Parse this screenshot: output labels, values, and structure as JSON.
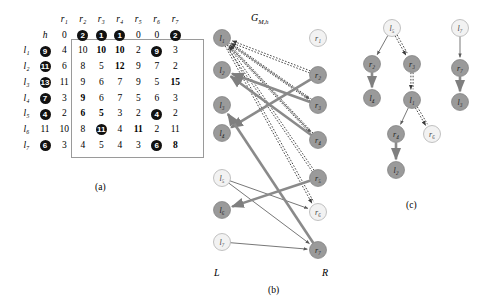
{
  "figure": {
    "panels": [
      {
        "id": "a",
        "caption": "(a)"
      },
      {
        "id": "b",
        "caption": "(b)"
      },
      {
        "id": "c",
        "caption": "(c)"
      }
    ]
  },
  "matrix": {
    "h_label": "h",
    "col_headers": [
      "r₁",
      "r₂",
      "r₃",
      "r₄",
      "r₅",
      "r₆",
      "r₇"
    ],
    "h_row": [
      {
        "v": "0",
        "style": "plain"
      },
      {
        "v": "2",
        "style": "circled"
      },
      {
        "v": "1",
        "style": "circled"
      },
      {
        "v": "1",
        "style": "circled"
      },
      {
        "v": "0",
        "style": "plain"
      },
      {
        "v": "0",
        "style": "plain"
      },
      {
        "v": "2",
        "style": "circled"
      }
    ],
    "rows": [
      {
        "label": "l₁",
        "h": {
          "v": "9",
          "style": "circled"
        },
        "cells": [
          {
            "v": "4",
            "style": "plain"
          },
          {
            "v": "10",
            "style": "plain"
          },
          {
            "v": "10",
            "style": "bold"
          },
          {
            "v": "10",
            "style": "bold"
          },
          {
            "v": "2",
            "style": "plain"
          },
          {
            "v": "9",
            "style": "circled"
          },
          {
            "v": "3",
            "style": "plain"
          }
        ]
      },
      {
        "label": "l₂",
        "h": {
          "v": "11",
          "style": "circled"
        },
        "cells": [
          {
            "v": "6",
            "style": "plain"
          },
          {
            "v": "8",
            "style": "plain"
          },
          {
            "v": "5",
            "style": "plain"
          },
          {
            "v": "12",
            "style": "bold"
          },
          {
            "v": "9",
            "style": "plain"
          },
          {
            "v": "7",
            "style": "plain"
          },
          {
            "v": "2",
            "style": "plain"
          }
        ]
      },
      {
        "label": "l₃",
        "h": {
          "v": "13",
          "style": "circled"
        },
        "cells": [
          {
            "v": "11",
            "style": "plain"
          },
          {
            "v": "9",
            "style": "plain"
          },
          {
            "v": "6",
            "style": "plain"
          },
          {
            "v": "7",
            "style": "plain"
          },
          {
            "v": "9",
            "style": "plain"
          },
          {
            "v": "5",
            "style": "plain"
          },
          {
            "v": "15",
            "style": "bold"
          }
        ]
      },
      {
        "label": "l₄",
        "h": {
          "v": "7",
          "style": "circled"
        },
        "cells": [
          {
            "v": "3",
            "style": "plain"
          },
          {
            "v": "9",
            "style": "bold"
          },
          {
            "v": "6",
            "style": "plain"
          },
          {
            "v": "7",
            "style": "plain"
          },
          {
            "v": "5",
            "style": "plain"
          },
          {
            "v": "6",
            "style": "plain"
          },
          {
            "v": "3",
            "style": "plain"
          }
        ]
      },
      {
        "label": "l₅",
        "h": {
          "v": "4",
          "style": "circled"
        },
        "cells": [
          {
            "v": "2",
            "style": "plain"
          },
          {
            "v": "6",
            "style": "bold"
          },
          {
            "v": "5",
            "style": "bold"
          },
          {
            "v": "3",
            "style": "plain"
          },
          {
            "v": "2",
            "style": "plain"
          },
          {
            "v": "4",
            "style": "circled"
          },
          {
            "v": "2",
            "style": "plain"
          }
        ]
      },
      {
        "label": "l₆",
        "h": {
          "v": "11",
          "style": "plain"
        },
        "cells": [
          {
            "v": "10",
            "style": "plain"
          },
          {
            "v": "8",
            "style": "plain"
          },
          {
            "v": "11",
            "style": "circled"
          },
          {
            "v": "4",
            "style": "plain"
          },
          {
            "v": "11",
            "style": "bold"
          },
          {
            "v": "2",
            "style": "plain"
          },
          {
            "v": "11",
            "style": "plain"
          }
        ]
      },
      {
        "label": "l₇",
        "h": {
          "v": "6",
          "style": "circled"
        },
        "cells": [
          {
            "v": "3",
            "style": "plain"
          },
          {
            "v": "4",
            "style": "plain"
          },
          {
            "v": "5",
            "style": "plain"
          },
          {
            "v": "4",
            "style": "plain"
          },
          {
            "v": "3",
            "style": "plain"
          },
          {
            "v": "6",
            "style": "circled"
          },
          {
            "v": "8",
            "style": "bold"
          }
        ]
      }
    ]
  },
  "graph": {
    "title": "G",
    "title_sub": "M,h",
    "left_axis_label": "L",
    "right_axis_label": "R",
    "left_nodes": [
      {
        "id": "l1",
        "label": "l₁",
        "fill": "gray"
      },
      {
        "id": "l2",
        "label": "l₂",
        "fill": "gray"
      },
      {
        "id": "l3",
        "label": "l₃",
        "fill": "gray"
      },
      {
        "id": "l4",
        "label": "l₄",
        "fill": "gray"
      },
      {
        "id": "l5",
        "label": "l₅",
        "fill": "white"
      },
      {
        "id": "l6",
        "label": "l₆",
        "fill": "gray"
      },
      {
        "id": "l7",
        "label": "l₇",
        "fill": "white"
      }
    ],
    "right_nodes": [
      {
        "id": "r1",
        "label": "r₁",
        "fill": "white"
      },
      {
        "id": "r2",
        "label": "r₂",
        "fill": "gray"
      },
      {
        "id": "r3",
        "label": "r₃",
        "fill": "gray"
      },
      {
        "id": "r4",
        "label": "r₄",
        "fill": "gray"
      },
      {
        "id": "r5",
        "label": "r₅",
        "fill": "gray"
      },
      {
        "id": "r6",
        "label": "r₆",
        "fill": "white"
      },
      {
        "id": "r7",
        "label": "r₇",
        "fill": "gray"
      }
    ],
    "edges": [
      {
        "from": "l1",
        "to": "r3",
        "style": "thin"
      },
      {
        "from": "l1",
        "to": "r4",
        "style": "thin"
      },
      {
        "from": "l1",
        "to": "r6",
        "style": "dotted"
      },
      {
        "from": "l5",
        "to": "r6",
        "style": "thin"
      },
      {
        "from": "l5",
        "to": "r7",
        "style": "thin"
      },
      {
        "from": "l7",
        "to": "r7",
        "style": "thin"
      },
      {
        "from": "r2",
        "to": "l1",
        "style": "dotted"
      },
      {
        "from": "r3",
        "to": "l1",
        "style": "dotted"
      },
      {
        "from": "r4",
        "to": "l1",
        "style": "dotted"
      },
      {
        "from": "r5",
        "to": "l1",
        "style": "dotted"
      },
      {
        "from": "r2",
        "to": "l4",
        "style": "thick"
      },
      {
        "from": "r3",
        "to": "l2",
        "style": "thick"
      },
      {
        "from": "r4",
        "to": "l2",
        "style": "thick"
      },
      {
        "from": "r5",
        "to": "l6",
        "style": "thick"
      },
      {
        "from": "r7",
        "to": "l3",
        "style": "thick"
      }
    ]
  },
  "trees": {
    "left_tree": {
      "nodes": [
        {
          "id": "t_l5",
          "label": "l₅",
          "fill": "white"
        },
        {
          "id": "t_r2",
          "label": "r₂",
          "fill": "gray"
        },
        {
          "id": "t_r3",
          "label": "r₃",
          "fill": "gray"
        },
        {
          "id": "t_l4",
          "label": "l₄",
          "fill": "gray"
        },
        {
          "id": "t_l1",
          "label": "l₁",
          "fill": "gray"
        },
        {
          "id": "t_r4",
          "label": "r₄",
          "fill": "gray"
        },
        {
          "id": "t_r6",
          "label": "r₆",
          "fill": "white"
        },
        {
          "id": "t_l2",
          "label": "l₂",
          "fill": "gray"
        }
      ],
      "edges": [
        {
          "from": "t_l5",
          "to": "t_r2",
          "style": "thin"
        },
        {
          "from": "t_l5",
          "to": "t_r3",
          "style": "dotted"
        },
        {
          "from": "t_r2",
          "to": "t_l4",
          "style": "thick"
        },
        {
          "from": "t_r3",
          "to": "t_l1",
          "style": "dotted"
        },
        {
          "from": "t_l1",
          "to": "t_r4",
          "style": "thin"
        },
        {
          "from": "t_l1",
          "to": "t_r6",
          "style": "dotted"
        },
        {
          "from": "t_r4",
          "to": "t_l2",
          "style": "thick"
        }
      ]
    },
    "right_tree": {
      "nodes": [
        {
          "id": "t_l7",
          "label": "l₇",
          "fill": "white"
        },
        {
          "id": "t_r7",
          "label": "r₇",
          "fill": "gray"
        },
        {
          "id": "t_l3",
          "label": "l₃",
          "fill": "gray"
        }
      ],
      "edges": [
        {
          "from": "t_l7",
          "to": "t_r7",
          "style": "thin"
        },
        {
          "from": "t_r7",
          "to": "t_l3",
          "style": "thick"
        }
      ]
    }
  }
}
